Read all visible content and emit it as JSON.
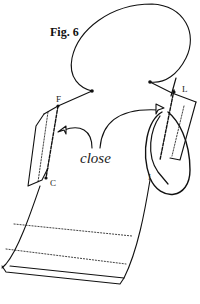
{
  "figure": {
    "title": "Fig. 6",
    "annotation": "close",
    "labels": {
      "f": "F",
      "c": "C",
      "l": "L",
      "i": "I"
    }
  },
  "colors": {
    "line": "#111111",
    "background": "#ffffff"
  }
}
